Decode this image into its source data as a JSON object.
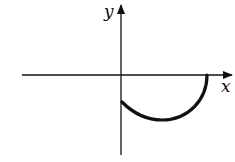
{
  "figure": {
    "type": "function-graph-sketch",
    "axes": {
      "x_label": "x",
      "y_label": "y"
    },
    "curve": {
      "description": "lower semicircle-like arc below x-axis, starting on negative y-axis and ending on positive x-axis",
      "start": "point on negative y-axis",
      "end": "point on positive x-axis"
    },
    "colors": {
      "stroke": "#111111",
      "background": "#ffffff"
    }
  }
}
